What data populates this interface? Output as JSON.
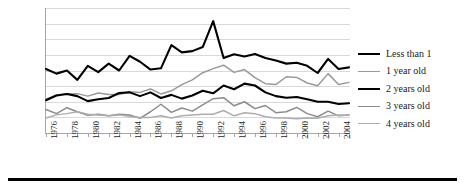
{
  "chart_data": {
    "type": "line",
    "title": "",
    "xlabel": "",
    "ylabel": "",
    "xlim": [
      1976,
      2005
    ],
    "ylim": [
      0,
      400
    ],
    "grid": true,
    "legend_position": "right",
    "x": [
      1976,
      1977,
      1978,
      1979,
      1980,
      1981,
      1982,
      1983,
      1984,
      1985,
      1986,
      1987,
      1988,
      1989,
      1990,
      1991,
      1992,
      1993,
      1994,
      1995,
      1996,
      1997,
      1998,
      1999,
      2000,
      2001,
      2002,
      2003,
      2004,
      2005
    ],
    "ytick_labels": [
      "400",
      "350",
      "300",
      "250",
      "200",
      "150",
      "100",
      "50",
      "0"
    ],
    "ytick_values": [
      400,
      350,
      300,
      250,
      200,
      150,
      100,
      50,
      0
    ],
    "xtick_labels": [
      "1976",
      "1978",
      "1980",
      "1982",
      "1984",
      "1986",
      "1988",
      "1990",
      "1992",
      "1994",
      "1996",
      "1998",
      "2000",
      "2002",
      "2004"
    ],
    "series": [
      {
        "name": "Less than 1",
        "color": "#000000",
        "width": 2.1,
        "values": [
          205,
          190,
          200,
          170,
          215,
          195,
          222,
          200,
          247,
          228,
          203,
          207,
          281,
          258,
          262,
          275,
          358,
          240,
          252,
          245,
          253,
          240,
          232,
          222,
          225,
          215,
          192,
          237,
          205,
          210
        ]
      },
      {
        "name": "1 year old",
        "color": "#9a9a9a",
        "width": 1.5,
        "values": [
          108,
          122,
          125,
          126,
          118,
          128,
          123,
          123,
          132,
          130,
          141,
          125,
          135,
          155,
          170,
          193,
          206,
          217,
          194,
          203,
          177,
          158,
          155,
          180,
          178,
          160,
          151,
          190,
          155,
          162
        ]
      },
      {
        "name": "2 years old",
        "color": "#000000",
        "width": 2.1,
        "values": [
          105,
          120,
          125,
          118,
          102,
          108,
          112,
          128,
          130,
          118,
          130,
          112,
          122,
          110,
          120,
          135,
          127,
          152,
          140,
          158,
          152,
          130,
          118,
          113,
          115,
          108,
          100,
          100,
          93,
          95
        ]
      },
      {
        "name": "3 years old",
        "color": "#8c8c8c",
        "width": 1.5,
        "values": [
          75,
          62,
          81,
          68,
          57,
          60,
          55,
          60,
          58,
          47,
          68,
          92,
          66,
          80,
          70,
          90,
          110,
          113,
          87,
          100,
          78,
          88,
          65,
          68,
          82,
          62,
          52,
          70,
          55,
          58
        ]
      },
      {
        "name": "4 years old",
        "color": "#adadad",
        "width": 1.5,
        "values": [
          48,
          58,
          62,
          68,
          60,
          58,
          55,
          58,
          53,
          50,
          50,
          55,
          48,
          55,
          58,
          60,
          60,
          72,
          55,
          65,
          62,
          52,
          48,
          48,
          46,
          48,
          47,
          55,
          58,
          57
        ]
      }
    ]
  },
  "legend": {
    "items": [
      {
        "label": "Less than 1"
      },
      {
        "label": "1 year old"
      },
      {
        "label": "2 years old"
      },
      {
        "label": "3 years old"
      },
      {
        "label": "4 years old"
      }
    ]
  }
}
